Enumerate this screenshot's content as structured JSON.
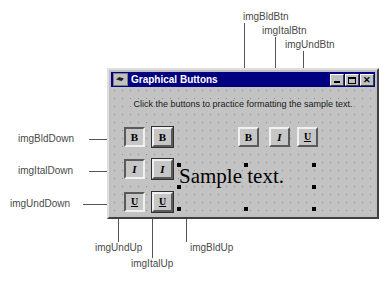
{
  "figure": {
    "callouts_top": [
      {
        "id": "imgBldBtn",
        "label": "imgBldBtn"
      },
      {
        "id": "imgItalBtn",
        "label": "imgItalBtn"
      },
      {
        "id": "imgUndBtn",
        "label": "imgUndBtn"
      }
    ],
    "callouts_left": [
      {
        "id": "imgBldDown",
        "label": "imgBldDown"
      },
      {
        "id": "imgItalDown",
        "label": "imgItalDown"
      },
      {
        "id": "imgUndDown",
        "label": "imgUndDown"
      }
    ],
    "callouts_bottom": [
      {
        "id": "imgUndUp",
        "label": "imgUndUp"
      },
      {
        "id": "imgItalUp",
        "label": "imgItalUp"
      },
      {
        "id": "imgBldUp",
        "label": "imgBldUp"
      }
    ],
    "leader_color": "#555555",
    "label_color": "#4a4a4a"
  },
  "window": {
    "title": "Graphical Buttons",
    "icon": "vb-form-icon",
    "titlebar_color": "#000080",
    "face_color": "#c0c0c0",
    "controls": {
      "minimize": "_",
      "maximize": "□",
      "close": "✕"
    }
  },
  "form": {
    "instruction": "Click the buttons to practice formatting the sample text.",
    "sample_text": "Sample text.",
    "buttons": {
      "bold_glyph": "B",
      "italic_glyph": "I",
      "underline_glyph": "U"
    },
    "toolbar_buttons": [
      {
        "name": "imgBldBtn",
        "glyph": "B",
        "state": "up"
      },
      {
        "name": "imgItalBtn",
        "glyph": "I",
        "state": "up"
      },
      {
        "name": "imgUndBtn",
        "glyph": "U",
        "state": "up"
      }
    ],
    "down_column": [
      {
        "name": "imgBldDown",
        "glyph": "B",
        "state": "down"
      },
      {
        "name": "imgItalDown",
        "glyph": "I",
        "state": "down"
      },
      {
        "name": "imgUndDown",
        "glyph": "U",
        "state": "down"
      }
    ],
    "up_column": [
      {
        "name": "imgBldUp",
        "glyph": "B",
        "state": "up"
      },
      {
        "name": "imgItalUp",
        "glyph": "I",
        "state": "up"
      },
      {
        "name": "imgUndUp",
        "glyph": "U",
        "state": "up"
      }
    ]
  }
}
